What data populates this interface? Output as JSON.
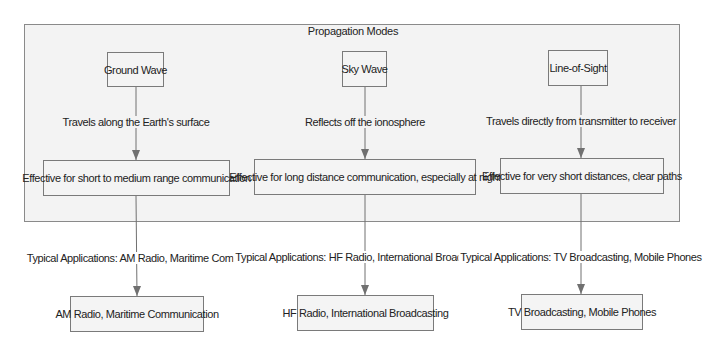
{
  "diagram": {
    "cluster_title": "Propagation Modes",
    "modes": [
      {
        "name": "Ground Wave",
        "propagation_label": "Travels along the Earth's surface",
        "effectiveness": "Effective for short to medium range communication",
        "applications_label": "Typical Applications: AM Radio, Maritime Comms",
        "applications": "AM Radio, Maritime Communication"
      },
      {
        "name": "Sky Wave",
        "propagation_label": "Reflects off the ionosphere",
        "effectiveness": "Effective for long distance communication, especially at night",
        "applications_label": "Typical Applications: HF Radio, International Broadcasting",
        "applications": "HF Radio, International Broadcasting"
      },
      {
        "name": "Line-of-Sight",
        "propagation_label": "Travels directly from transmitter to receiver",
        "effectiveness": "Effective for very short distances, clear paths",
        "applications_label": "Typical Applications: TV Broadcasting, Mobile Phones",
        "applications": "TV Broadcasting, Mobile Phones"
      }
    ],
    "colors": {
      "cluster_fill": "#f3f3f3",
      "node_fill": "#f4f4f4",
      "border": "#7a7a7a",
      "edge": "#707070"
    }
  }
}
